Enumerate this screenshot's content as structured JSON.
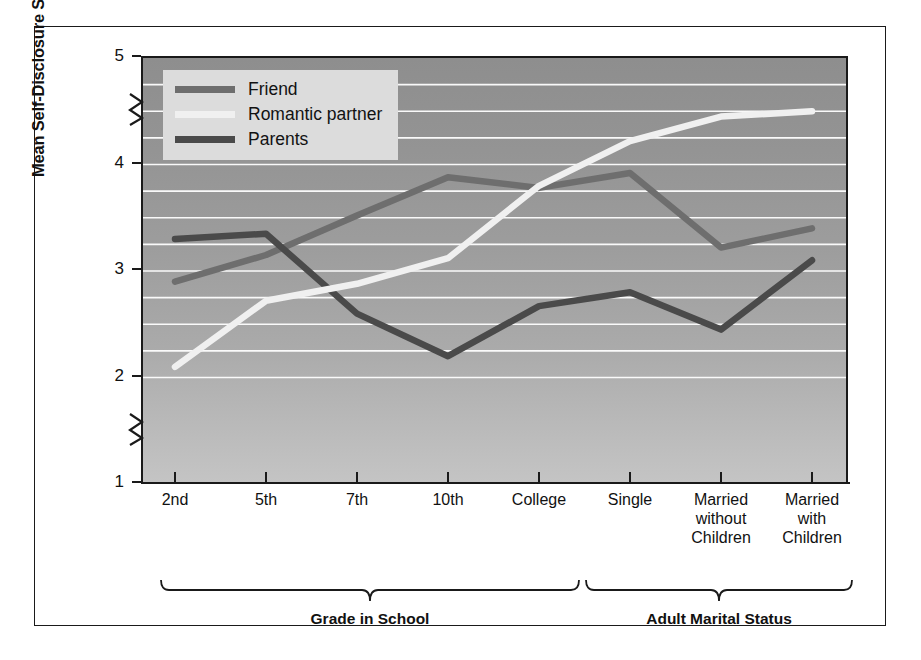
{
  "chart_data": {
    "type": "line",
    "title": "",
    "xlabel": "",
    "ylabel": "Mean Self-Disclosure Score",
    "categories": [
      "2nd",
      "5th",
      "7th",
      "10th",
      "College",
      "Single",
      "Married without Children",
      "Married with Children"
    ],
    "series": [
      {
        "name": "Friend",
        "color": "#6e6e6e",
        "values": [
          2.9,
          3.15,
          3.52,
          3.88,
          3.78,
          3.92,
          3.22,
          3.4
        ]
      },
      {
        "name": "Romantic partner",
        "color": "#f0f0f0",
        "values": [
          2.1,
          2.72,
          2.88,
          3.12,
          3.8,
          4.22,
          4.45,
          4.5
        ]
      },
      {
        "name": "Parents",
        "color": "#4a4a4a",
        "values": [
          3.3,
          3.35,
          2.6,
          2.2,
          2.67,
          2.8,
          2.45,
          3.1
        ]
      }
    ],
    "ylim": [
      1,
      5
    ],
    "y_ticks": [
      "5",
      "4",
      "3",
      "2",
      "1"
    ],
    "y_tick_values": [
      5,
      4,
      3,
      2,
      1
    ],
    "gridlines": [
      4.75,
      4.5,
      4.25,
      4.0,
      3.75,
      3.5,
      3.25,
      3.0,
      2.75,
      2.5,
      2.25,
      2.0
    ],
    "grid": true,
    "grid_color": "#ffffff",
    "axis_breaks": [
      4.5,
      1.5
    ],
    "legend_position": "top-left",
    "plot_background": "gray-gradient"
  },
  "axis": {
    "y_title": "Mean Self-Disclosure Score",
    "y_ticks": [
      "5",
      "4",
      "3",
      "2",
      "1"
    ],
    "x_ticks": [
      {
        "label": "2nd",
        "lines": [
          "2nd"
        ]
      },
      {
        "label": "5th",
        "lines": [
          "5th"
        ]
      },
      {
        "label": "7th",
        "lines": [
          "7th"
        ]
      },
      {
        "label": "10th",
        "lines": [
          "10th"
        ]
      },
      {
        "label": "College",
        "lines": [
          "College"
        ]
      },
      {
        "label": "Single",
        "lines": [
          "Single"
        ]
      },
      {
        "label": "Married without Children",
        "lines": [
          "Married",
          "without",
          "Children"
        ]
      },
      {
        "label": "Married with Children",
        "lines": [
          "Married",
          "with",
          "Children"
        ]
      }
    ]
  },
  "legend": {
    "items": [
      {
        "label": "Friend",
        "color": "#6e6e6e"
      },
      {
        "label": "Romantic partner",
        "color": "#f0f0f0"
      },
      {
        "label": "Parents",
        "color": "#4a4a4a"
      }
    ]
  },
  "groups": [
    {
      "label": "Grade in School"
    },
    {
      "label": "Adult Marital Status"
    }
  ]
}
